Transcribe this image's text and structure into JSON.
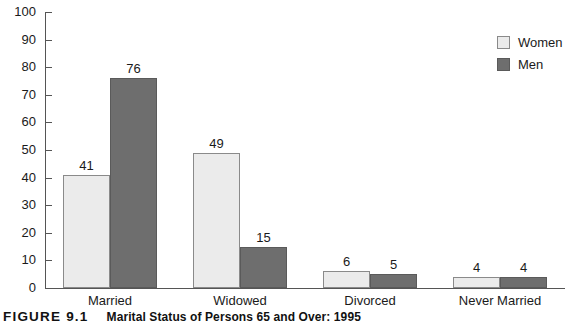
{
  "chart_data": {
    "type": "bar",
    "title": "Marital Status of Persons 65 and Over: 1995",
    "xlabel": "",
    "ylabel": "",
    "ylim": [
      0,
      100
    ],
    "yticks": [
      0,
      10,
      20,
      30,
      40,
      50,
      60,
      70,
      80,
      90,
      100
    ],
    "ytick_labels": [
      "0",
      "10",
      "20",
      "30",
      "40",
      "50",
      "60",
      "70",
      "80",
      "90",
      "100"
    ],
    "grid": false,
    "legend_position": "top-right",
    "categories": [
      "Married",
      "Widowed",
      "Divorced",
      "Never Married"
    ],
    "series": [
      {
        "name": "Women",
        "color": "#ebebeb",
        "values": [
          41,
          49,
          6,
          4
        ]
      },
      {
        "name": "Men",
        "color": "#6e6e6e",
        "values": [
          76,
          15,
          5,
          4
        ]
      }
    ]
  },
  "legend": {
    "items": [
      {
        "label": "Women",
        "swatch": "light-gray-square"
      },
      {
        "label": "Men",
        "swatch": "dark-gray-square"
      }
    ]
  },
  "caption": {
    "figure_number": "FIGURE 9.1",
    "title": "Marital Status of Persons 65 and Over: 1995"
  }
}
